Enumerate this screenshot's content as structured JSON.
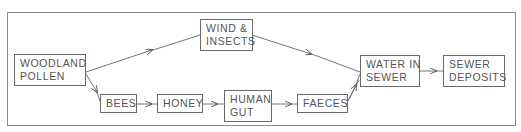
{
  "diagram": {
    "type": "flowchart",
    "nodes": {
      "woodland_pollen": {
        "line1": "WOODLAND",
        "line2": "POLLEN"
      },
      "wind_insects": {
        "line1": "WIND &",
        "line2": "INSECTS"
      },
      "bees": {
        "line1": "BEES"
      },
      "honey": {
        "line1": "HONEY"
      },
      "human_gut": {
        "line1": "HUMAN",
        "line2": "GUT"
      },
      "faeces": {
        "line1": "FAECES"
      },
      "water_in_sewer": {
        "line1": "WATER IN",
        "line2": "SEWER"
      },
      "sewer_deposits": {
        "line1": "SEWER",
        "line2": "DEPOSITS"
      }
    },
    "edges": [
      {
        "from": "WOODLAND POLLEN",
        "to": "WIND & INSECTS"
      },
      {
        "from": "WOODLAND POLLEN",
        "to": "BEES"
      },
      {
        "from": "BEES",
        "to": "HONEY"
      },
      {
        "from": "HONEY",
        "to": "HUMAN GUT"
      },
      {
        "from": "HUMAN GUT",
        "to": "FAECES"
      },
      {
        "from": "WIND & INSECTS",
        "to": "WATER IN SEWER"
      },
      {
        "from": "FAECES",
        "to": "WATER IN SEWER"
      },
      {
        "from": "WATER IN SEWER",
        "to": "SEWER DEPOSITS"
      }
    ],
    "colors": {
      "line": "#6a6a6a",
      "text": "#555555",
      "frame": "#8a8a8a"
    }
  }
}
